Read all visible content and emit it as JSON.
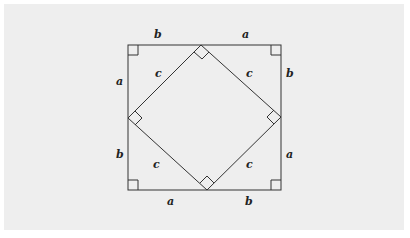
{
  "diagram": {
    "title": "",
    "square": {
      "x1": 128,
      "y1": 45,
      "x2": 281,
      "y2": 190
    },
    "inner_vertices": {
      "top": [
        201,
        45
      ],
      "left": [
        128,
        118
      ],
      "right": [
        281,
        117
      ],
      "bottom": [
        207,
        190
      ]
    },
    "labels": {
      "top_left": "b",
      "top_right": "a",
      "left_top": "a",
      "left_bottom": "b",
      "right_top": "b",
      "right_bottom": "a",
      "bottom_left": "a",
      "bottom_right": "b",
      "hyp_top_left": "c",
      "hyp_top_right": "c",
      "hyp_bottom_left": "c",
      "hyp_bottom_right": "c"
    },
    "colors": {
      "background": "#eeeeee",
      "line": "#333333"
    }
  }
}
